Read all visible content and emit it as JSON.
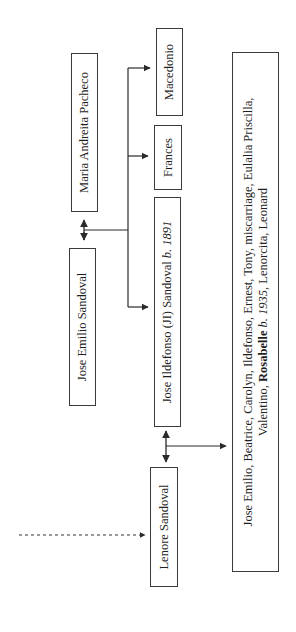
{
  "diagram": {
    "type": "family-tree",
    "orientation": "rotated-90-ccw",
    "nodes": {
      "maria": {
        "label": "Maria Andreita Pacheco"
      },
      "jose_emilio": {
        "label": "Jose Emilio Sandoval"
      },
      "macedonio": {
        "label": "Macedonio"
      },
      "frances": {
        "label": "Frances"
      },
      "jose_ildefonso": {
        "name": "Jose Ildefonso (JI) Sandoval ",
        "born_prefix": "b.",
        "born_year": "1891"
      },
      "lenore": {
        "label": "Lenore Sandoval"
      },
      "children": {
        "line1": "Jose Emilio, Beatrice, Carolyn, Ildefonso, Ernest, Tony, miscarriage, Eulalia Priscilla,",
        "line2_prefix": "Valentino, ",
        "highlight_name": "Rosabelle",
        "born_prefix": " b.",
        "born_year": " 1935",
        "line2_suffix": ", Lenorcita, Leonard"
      }
    },
    "edges": [
      {
        "from": "jose_emilio",
        "to": "maria",
        "type": "marriage"
      },
      {
        "from": "jose_emilio+maria",
        "to": "jose_ildefonso",
        "type": "child"
      },
      {
        "from": "jose_emilio+maria",
        "to": "frances",
        "type": "child"
      },
      {
        "from": "jose_emilio+maria",
        "to": "macedonio",
        "type": "child"
      },
      {
        "from": "jose_ildefonso",
        "to": "lenore",
        "type": "marriage"
      },
      {
        "from": "jose_ildefonso+lenore",
        "to": "children",
        "type": "child"
      },
      {
        "from": "external",
        "to": "lenore",
        "type": "dashed-lineage"
      }
    ]
  }
}
